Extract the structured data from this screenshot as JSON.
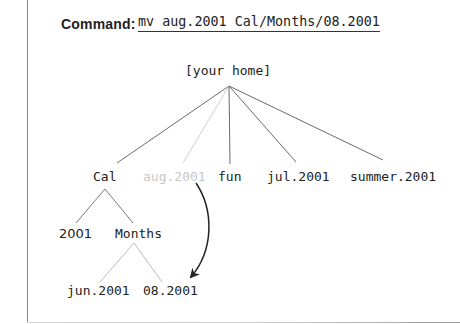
{
  "command": {
    "label": "Command:",
    "text": "mv aug.2001 Cal/Months/08.2001"
  },
  "tree": {
    "root": "[your home]",
    "children": {
      "cal": "Cal",
      "aug": "aug.2001",
      "fun": "fun",
      "jul": "jul.2001",
      "summer": "summer.2001"
    },
    "cal_children": {
      "y2001": "2001",
      "months": "Months"
    },
    "months_children": {
      "jun": "jun.2001",
      "aug_new": "08.2001"
    }
  },
  "colors": {
    "line": "#6a6a6a",
    "light_line": "#c0c0c0",
    "ghost_text": "#c8c8c8",
    "arrow": "#222222"
  }
}
